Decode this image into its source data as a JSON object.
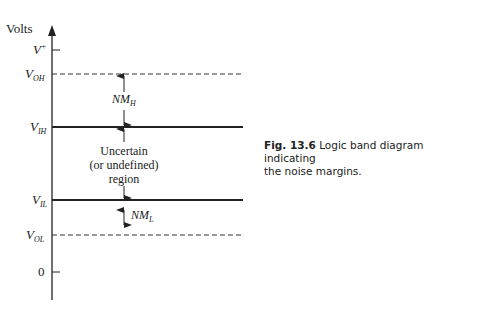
{
  "axis": {
    "label": "Volts"
  },
  "levels": [
    {
      "id": "vplus",
      "name": "V",
      "sup": "+",
      "sub": "",
      "style": "tick"
    },
    {
      "id": "voh",
      "name": "V",
      "sup": "",
      "sub": "OH",
      "style": "dashed"
    },
    {
      "id": "vih",
      "name": "V",
      "sup": "",
      "sub": "IH",
      "style": "solid"
    },
    {
      "id": "vil",
      "name": "V",
      "sup": "",
      "sub": "IL",
      "style": "solid"
    },
    {
      "id": "vol",
      "name": "V",
      "sup": "",
      "sub": "OL",
      "style": "dashed"
    },
    {
      "id": "zero",
      "name": "0",
      "sup": "",
      "sub": "",
      "style": "tick"
    }
  ],
  "annotations": {
    "nmh": {
      "name": "NM",
      "sub": "H"
    },
    "nml": {
      "name": "NM",
      "sub": "L"
    },
    "region": [
      "Uncertain",
      "(or undefined)",
      "region"
    ]
  },
  "caption": {
    "figure": "Fig. 13.6",
    "text_line1": "Logic band diagram indicating",
    "text_line2": "the noise margins."
  }
}
